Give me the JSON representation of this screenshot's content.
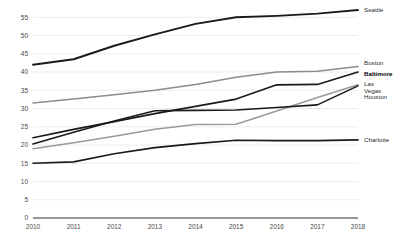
{
  "chart_data": {
    "type": "line",
    "title": "",
    "xlabel": "",
    "ylabel": "",
    "categories": [
      2010,
      2011,
      2012,
      2013,
      2014,
      2015,
      2016,
      2017,
      2018
    ],
    "x": [
      2010,
      2011,
      2012,
      2013,
      2014,
      2015,
      2016,
      2017,
      2018
    ],
    "ylim": [
      0,
      57
    ],
    "xlim": [
      2010,
      2018
    ],
    "yticks": [
      0,
      5,
      10,
      15,
      20,
      25,
      30,
      35,
      40,
      45,
      50,
      55
    ],
    "ytick_labels": [
      "0",
      "5",
      "10",
      "15",
      "20",
      "25",
      "30",
      "35",
      "40",
      "45",
      "50",
      "55"
    ],
    "xtick_labels": [
      "2010",
      "2011",
      "2012",
      "2013",
      "2014",
      "2015",
      "2016",
      "2017",
      "2018"
    ],
    "grid": true,
    "grid_axis": "y",
    "legend_position": "right",
    "series": [
      {
        "name": "Seattle",
        "color": "#1a1a1a",
        "width": 1.9,
        "bold_label": false,
        "values": [
          42.0,
          43.5,
          47.2,
          50.3,
          53.2,
          55.0,
          55.4,
          56.0,
          57.0
        ]
      },
      {
        "name": "Boston",
        "color": "#8c8c8c",
        "width": 1.5,
        "bold_label": false,
        "values": [
          31.5,
          32.6,
          33.8,
          35.0,
          36.6,
          38.6,
          40.0,
          40.2,
          41.5
        ]
      },
      {
        "name": "Baltimore",
        "color": "#1a1a1a",
        "width": 1.7,
        "bold_label": true,
        "values": [
          22.0,
          24.3,
          26.4,
          28.6,
          30.6,
          32.6,
          36.5,
          36.6,
          40.0
        ]
      },
      {
        "name": "Las Vegas",
        "color": "#9a9a9a",
        "width": 1.5,
        "bold_label": false,
        "values": [
          19.0,
          20.6,
          22.4,
          24.3,
          25.6,
          25.7,
          29.3,
          33.0,
          36.5
        ]
      },
      {
        "name": "Houston",
        "color": "#1a1a1a",
        "width": 1.6,
        "bold_label": false,
        "values": [
          20.3,
          23.5,
          26.6,
          29.4,
          29.5,
          29.6,
          30.3,
          31.0,
          36.2
        ]
      },
      {
        "name": "Charlotte",
        "color": "#1a1a1a",
        "width": 1.7,
        "bold_label": false,
        "values": [
          15.0,
          15.4,
          17.6,
          19.3,
          20.4,
          21.3,
          21.2,
          21.2,
          21.4
        ]
      }
    ],
    "legend_entries": [
      {
        "label": "Seattle",
        "bold": false
      },
      {
        "label": "Boston",
        "bold": false
      },
      {
        "label": "Baltimore",
        "bold": true
      },
      {
        "label": "Las",
        "bold": false
      },
      {
        "label": "Vegas",
        "bold": false
      },
      {
        "label": "Houston",
        "bold": false
      },
      {
        "label": "Charlotte",
        "bold": false
      }
    ]
  }
}
